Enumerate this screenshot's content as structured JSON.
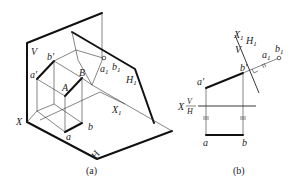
{
  "figure_a": {
    "caption": "(a)",
    "labels": {
      "V": "V",
      "b_prime": "b'",
      "a_prime": "a'",
      "B": "B",
      "A": "A",
      "a1": "a",
      "a1_sub": "1",
      "b1": "b",
      "b1_sub": "1",
      "H1": "H",
      "H1_sub": "1",
      "X": "X",
      "X1": "X",
      "X1_sub": "1",
      "a": "a",
      "b": "b",
      "H": "H"
    }
  },
  "figure_b": {
    "caption": "(b)",
    "labels": {
      "X1": "X",
      "X1_sub": "1",
      "H1": "H",
      "H1_sub": "1",
      "V": "V",
      "a1": "a",
      "a1_sub": "1",
      "b1": "b",
      "b1_sub": "1",
      "a_prime": "a'",
      "b_prime": "b'",
      "X": "X",
      "V_axis": "V",
      "H_axis": "H",
      "a": "a",
      "b": "b"
    }
  }
}
